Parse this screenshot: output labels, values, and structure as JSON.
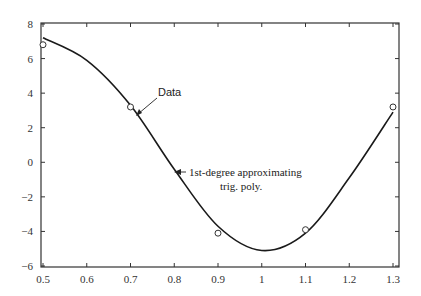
{
  "chart_data": {
    "type": "line",
    "title": "",
    "xlabel": "",
    "ylabel": "",
    "xlim": [
      0.5,
      1.3
    ],
    "ylim": [
      -6,
      8
    ],
    "grid": false,
    "x_ticks": [
      "0.5",
      "0.6",
      "0.7",
      "0.8",
      "0.9",
      "1",
      "1.1",
      "1.2",
      "1.3"
    ],
    "y_ticks": [
      "8",
      "6",
      "4",
      "2",
      "0",
      "-2",
      "-4",
      "-6"
    ],
    "series": [
      {
        "name": "Data",
        "style": "markers-open-circle",
        "x": [
          0.5,
          0.7,
          0.9,
          1.1,
          1.3
        ],
        "y": [
          6.8,
          3.2,
          -4.1,
          -3.9,
          3.2
        ]
      },
      {
        "name": "1st-degree approximating trig. poly.",
        "style": "line",
        "x": [
          0.5,
          0.6,
          0.7,
          0.8,
          0.9,
          1.0,
          1.1,
          1.2,
          1.3
        ],
        "y": [
          7.2,
          5.9,
          3.3,
          -0.4,
          -3.7,
          -5.1,
          -4.1,
          -0.9,
          2.9
        ]
      }
    ],
    "annotations": [
      {
        "text": "Data",
        "points_to": [
          0.7,
          3.2
        ]
      },
      {
        "text_line1": "1st-degree approximating",
        "text_line2": "trig. poly.",
        "points_to": [
          0.8,
          -0.4
        ]
      }
    ],
    "colors": {
      "line": "#1a1a1a",
      "axes": "#333333",
      "marker": "#333333"
    }
  }
}
